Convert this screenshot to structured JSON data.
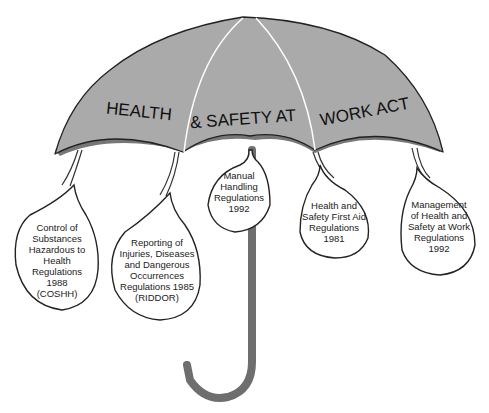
{
  "canopy": {
    "words": [
      "HEALTH",
      "& SAFETY AT",
      "WORK ACT"
    ],
    "fill_color": "#aaaaaa",
    "rib_color": "#ffffff"
  },
  "regulations": [
    {
      "id": "coshh",
      "lines": [
        "Control of",
        "Substances",
        "Hazardous to",
        "Health",
        "Regulations",
        "1988",
        "(COSHH)"
      ]
    },
    {
      "id": "riddor",
      "lines": [
        "Reporting of",
        "Injuries, Diseases",
        "and Dangerous",
        "Occurrences",
        "Regulations 1985",
        "(RIDDOR)"
      ]
    },
    {
      "id": "manual-handling",
      "lines": [
        "Manual",
        "Handling",
        "Regulations",
        "1992"
      ]
    },
    {
      "id": "first-aid",
      "lines": [
        "Health and",
        "Safety First Aid",
        "Regulations",
        "1981"
      ]
    },
    {
      "id": "management",
      "lines": [
        "Management",
        "of Health and",
        "Safety at Work",
        "Regulations",
        "1992"
      ]
    }
  ],
  "handle_color": "#6e6e6e"
}
